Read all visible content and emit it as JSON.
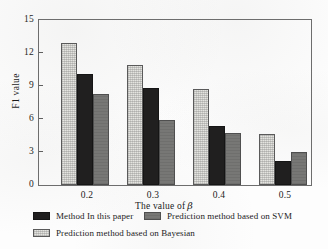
{
  "chart_data": {
    "type": "bar",
    "title": "",
    "xlabel": "The value of β",
    "ylabel": "F1 value",
    "categories": [
      "0.2",
      "0.3",
      "0.4",
      "0.5"
    ],
    "ylim": [
      0,
      15
    ],
    "yticks": [
      "0",
      "3",
      "6",
      "9",
      "12",
      "15"
    ],
    "grid": false,
    "legend_position": "bottom",
    "series": [
      {
        "name": "Prediction method based on Bayesian",
        "color": "#e4e4e0",
        "values": [
          12.9,
          10.9,
          8.7,
          4.6
        ]
      },
      {
        "name": "Method In this paper",
        "color": "#201f1f",
        "values": [
          10.1,
          8.8,
          5.4,
          2.2
        ]
      },
      {
        "name": "Prediction method based on SVM",
        "color": "#777775",
        "values": [
          8.3,
          5.9,
          4.7,
          3.0
        ]
      }
    ]
  },
  "axes": {
    "y_title": "F1 value",
    "x_title_prefix": "The value of",
    "x_title_symbol": "β",
    "y_ticks": [
      "15",
      "12",
      "9",
      "6",
      "3",
      "0"
    ],
    "x_ticks": [
      "0.2",
      "0.3",
      "0.4",
      "0.5"
    ]
  },
  "legend": {
    "items": [
      {
        "label": "Method In this paper",
        "swatch": "paper"
      },
      {
        "label": "Prediction method based on SVM",
        "swatch": "svm"
      },
      {
        "label": "Prediction method based on Bayesian",
        "swatch": "bayesian"
      }
    ]
  }
}
